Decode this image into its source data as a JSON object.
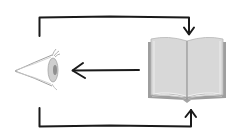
{
  "diagram": {
    "nodes": [
      {
        "id": "eye",
        "label": "",
        "icon": "eye-icon"
      },
      {
        "id": "book",
        "label": "",
        "icon": "open-book-icon"
      }
    ],
    "edges": [
      {
        "from": "book",
        "to": "eye",
        "style": "arrow",
        "path": "direct"
      },
      {
        "from": "eye",
        "to": "book",
        "style": "arrow",
        "path": "top-bracket"
      },
      {
        "from": "eye",
        "to": "book",
        "style": "arrow",
        "path": "bottom-bracket"
      }
    ],
    "colors": {
      "stroke": "#1a1a1a",
      "book_page": "#d6d6d6",
      "book_edge": "#a8a8a8",
      "eye_line": "#9a9a9a",
      "iris": "#bdbdbd",
      "pupil": "#8a8a8a",
      "background": "#ffffff"
    }
  }
}
